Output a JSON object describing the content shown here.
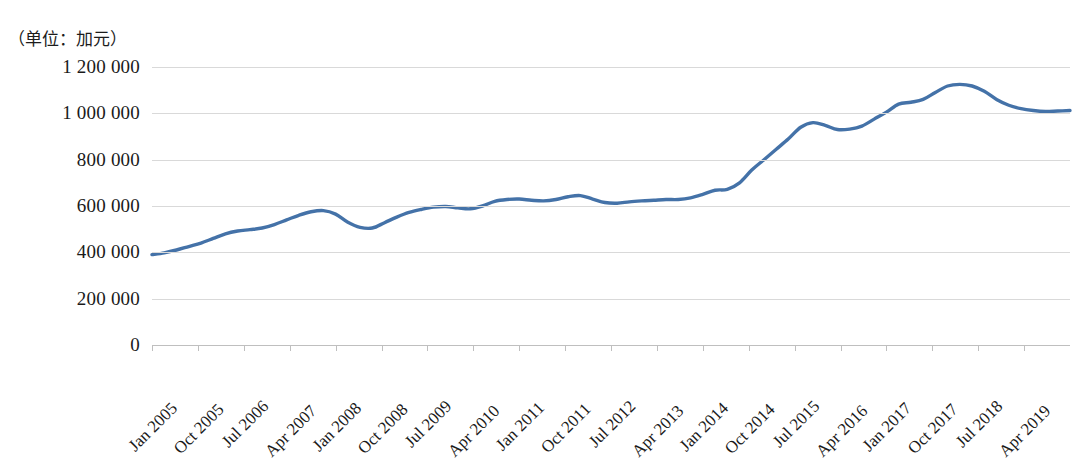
{
  "figure": {
    "unit_caption": "（单位：加元）",
    "background_color": "#ffffff",
    "gridline_color": "#d9d9d9"
  },
  "chart_data": {
    "type": "line",
    "title": "",
    "subtitle": "",
    "unit_label": "（单位：加元）",
    "xlabel": "",
    "ylabel": "",
    "ylim": [
      0,
      1200000
    ],
    "y_ticks": [
      0,
      200000,
      400000,
      600000,
      800000,
      1000000,
      1200000
    ],
    "y_tick_labels": [
      "0",
      "200 000",
      "400 000",
      "600 000",
      "800 000",
      "1 000 000",
      "1 200 000"
    ],
    "grid": true,
    "grid_axis": "y",
    "legend": false,
    "legend_position": "none",
    "line_color": "#4472a8",
    "line_width": 3.4,
    "x_tick_labels": [
      "Jan 2005",
      "Oct 2005",
      "Jul 2006",
      "Apr 2007",
      "Jan 2008",
      "Oct 2008",
      "Jul 2009",
      "Apr 2010",
      "Jan 2011",
      "Oct 2011",
      "Jul 2012",
      "Apr 2013",
      "Jan 2014",
      "Oct 2014",
      "Jul 2015",
      "Apr 2016",
      "Jan 2017",
      "Oct 2017",
      "Jul 2018",
      "Apr 2019"
    ],
    "x_tick_interval_months": 9,
    "x_start": "Jan 2005",
    "x_end": "Dec 2019",
    "series": [
      {
        "name": "加拿大房价指数",
        "color": "#4472a8",
        "x": [
          "Jan 2005",
          "Apr 2005",
          "Jul 2005",
          "Oct 2005",
          "Jan 2006",
          "Apr 2006",
          "Jul 2006",
          "Oct 2006",
          "Jan 2007",
          "Apr 2007",
          "Jul 2007",
          "Oct 2007",
          "Jan 2008",
          "Apr 2008",
          "Jul 2008",
          "Oct 2008",
          "Jan 2009",
          "Apr 2009",
          "Jul 2009",
          "Oct 2009",
          "Jan 2010",
          "Apr 2010",
          "Jul 2010",
          "Oct 2010",
          "Jan 2011",
          "Apr 2011",
          "Jul 2011",
          "Oct 2011",
          "Jan 2012",
          "Apr 2012",
          "Jul 2012",
          "Oct 2012",
          "Jan 2013",
          "Apr 2013",
          "Jul 2013",
          "Oct 2013",
          "Jan 2014",
          "Apr 2014",
          "Jul 2014",
          "Oct 2014",
          "Jan 2015",
          "Apr 2015",
          "Jul 2015",
          "Oct 2015",
          "Jan 2016",
          "Apr 2016",
          "Jul 2016",
          "Oct 2016",
          "Jan 2017",
          "Apr 2017",
          "Jul 2017",
          "Oct 2017",
          "Jan 2018",
          "Apr 2018",
          "Jul 2018",
          "Oct 2018",
          "Jan 2019",
          "Apr 2019",
          "Jul 2019",
          "Oct 2019"
        ],
        "values": [
          390000,
          398000,
          410000,
          425000,
          440000,
          460000,
          480000,
          492000,
          498000,
          505000,
          520000,
          540000,
          560000,
          575000,
          580000,
          565000,
          530000,
          508000,
          505000,
          528000,
          552000,
          572000,
          585000,
          595000,
          598000,
          592000,
          588000,
          600000,
          620000,
          628000,
          630000,
          625000,
          622000,
          628000,
          640000,
          645000,
          630000,
          615000,
          612000,
          618000,
          622000,
          625000,
          628000,
          628000,
          635000,
          650000,
          668000,
          672000,
          700000,
          755000,
          800000,
          845000,
          890000,
          940000,
          960000,
          948000,
          930000,
          932000,
          945000,
          975000
        ],
        "values_tail": [
          1005000,
          1040000,
          1048000,
          1060000,
          1090000,
          1118000,
          1125000,
          1118000,
          1095000,
          1060000,
          1035000,
          1020000,
          1012000,
          1008000,
          1010000,
          1012000
        ],
        "notes": {
          "start_value": 390000,
          "pre_crisis_peak": 580000,
          "crisis_trough": 505000,
          "plateau_2011_2014": "610 000 – 645 000",
          "surge_2016_peak": 960000,
          "post_surge_dip": 930000,
          "all_time_peak": 1125000,
          "end_value": 1010000
        }
      }
    ]
  }
}
